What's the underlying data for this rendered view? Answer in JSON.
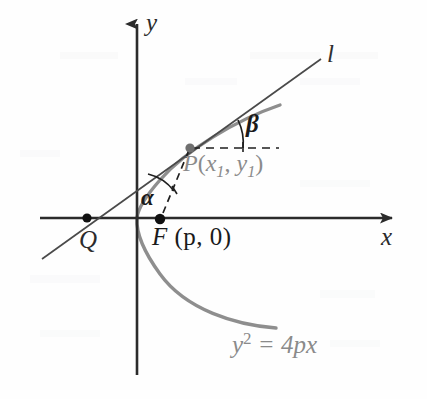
{
  "figure": {
    "kind": "geometry-diagram",
    "canvas": {
      "width": 427,
      "height": 399,
      "background": "#fefefe"
    },
    "colors": {
      "axis": "#2b2b2b",
      "curve": "#8e8e8e",
      "line": "#4a4a4a",
      "dashed": "#1f1f1f",
      "point": "#111111",
      "label_gray": "#8a8a8a",
      "label_black": "#1a1a1a"
    }
  },
  "axes": {
    "x_label": "x",
    "y_label": "y",
    "origin": {
      "x": 137,
      "y": 218
    },
    "x_axis": {
      "x_start": 40,
      "x_end": 397,
      "y": 218,
      "arrow": "right"
    },
    "y_axis": {
      "x": 137,
      "y_start": 18,
      "y_end": 375,
      "arrow": "up"
    }
  },
  "curve": {
    "equation_label": "y² = 4px",
    "equation_parts": {
      "base": "y",
      "exponent": "2",
      "rhs": "= 4px"
    },
    "type": "parabola",
    "opens": "right",
    "vertex": {
      "x": 137,
      "y": 218
    }
  },
  "line": {
    "label": "l",
    "description": "tangent-secant line through Q, F-region and P",
    "from": {
      "x": 42,
      "y": 259
    },
    "to": {
      "x": 321,
      "y": 59
    }
  },
  "points": [
    {
      "name": "Q",
      "label": "Q",
      "x": 87,
      "y": 218,
      "style": "filled"
    },
    {
      "name": "F",
      "label": "F (p, 0)",
      "x": 160,
      "y": 219,
      "style": "filled",
      "parts": {
        "name": "F",
        "coords": "(p, 0)"
      }
    },
    {
      "name": "P",
      "label": "P(x₁, y₁)",
      "x": 190,
      "y": 148,
      "style": "filled",
      "parts": {
        "name": "P",
        "x_sub": "1",
        "y_sub": "1"
      }
    }
  ],
  "angles": [
    {
      "name": "alpha",
      "label": "α",
      "vertex": "origin",
      "between": "line-l and dashed FP"
    },
    {
      "name": "beta",
      "label": "β",
      "vertex": "P",
      "between": "line-l and horizontal dashed ray"
    }
  ],
  "dashed_segments": [
    {
      "name": "focus-to-P",
      "from": {
        "x": 163,
        "y": 214
      },
      "to": {
        "x": 189,
        "y": 150
      }
    },
    {
      "name": "horizontal-from-P",
      "from": {
        "x": 192,
        "y": 148
      },
      "to": {
        "x": 279,
        "y": 148
      }
    }
  ]
}
